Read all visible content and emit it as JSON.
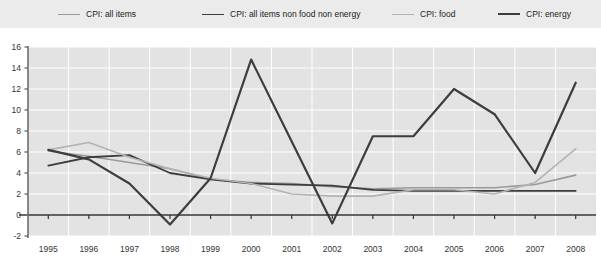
{
  "legend": {
    "position": "top",
    "items": [
      {
        "label": "CPI: all items",
        "color": "#9a9a9a",
        "width": 1.6,
        "x": 58
      },
      {
        "label": "CPI: all items non food non energy",
        "color": "#3d3d3d",
        "width": 1.8,
        "x": 202
      },
      {
        "label": "CPI:  food",
        "color": "#b3b3b3",
        "width": 1.6,
        "x": 392
      },
      {
        "label": "CPI:  energy",
        "color": "#3d3d3d",
        "width": 2.2,
        "x": 498
      }
    ]
  },
  "axes": {
    "y_ticks": [
      "16",
      "14",
      "12",
      "10",
      "8",
      "6",
      "4",
      "2",
      "0",
      "-2"
    ],
    "x_ticks": [
      "1995",
      "1996",
      "1997",
      "1998",
      "1999",
      "2000",
      "2001",
      "2002",
      "2003",
      "2004",
      "2005",
      "2006",
      "2007",
      "2008"
    ],
    "ylim": [
      -2,
      16
    ],
    "ystep": 2,
    "grid": true,
    "axis_color": "#6e6e6e",
    "grid_color": "#ffffff",
    "plot_bg": "#e3e3e3",
    "zero_line_color": "#333333"
  },
  "chart_data": {
    "type": "line",
    "title": "",
    "xlabel": "",
    "ylabel": "",
    "ylim": [
      -2,
      16
    ],
    "grid": true,
    "legend_position": "top",
    "x": [
      1995,
      1996,
      1997,
      1998,
      1999,
      2000,
      2001,
      2002,
      2003,
      2004,
      2005,
      2006,
      2007,
      2008
    ],
    "categories": [
      "1995",
      "1996",
      "1997",
      "1998",
      "1999",
      "2000",
      "2001",
      "2002",
      "2003",
      "2004",
      "2005",
      "2006",
      "2007",
      "2008"
    ],
    "series": [
      {
        "name": "CPI: all items",
        "color": "#9a9a9a",
        "width": 1.6,
        "values": [
          6.1,
          5.6,
          5.0,
          4.4,
          3.4,
          3.1,
          3.0,
          2.7,
          2.5,
          2.6,
          2.6,
          2.6,
          2.9,
          3.8
        ]
      },
      {
        "name": "CPI: all items non food non energy",
        "color": "#3d3d3d",
        "width": 1.8,
        "values": [
          4.7,
          5.5,
          5.7,
          4.0,
          3.4,
          3.0,
          2.9,
          2.8,
          2.4,
          2.3,
          2.3,
          2.3,
          2.3,
          2.3
        ]
      },
      {
        "name": "CPI:  food",
        "color": "#b3b3b3",
        "width": 1.6,
        "values": [
          6.2,
          6.9,
          5.5,
          4.4,
          3.5,
          3.0,
          2.0,
          1.8,
          1.8,
          2.4,
          2.4,
          2.0,
          3.1,
          6.3
        ]
      },
      {
        "name": "CPI:  energy",
        "color": "#3d3d3d",
        "width": 2.2,
        "values": [
          6.2,
          5.3,
          3.0,
          -0.9,
          3.5,
          14.8,
          7.0,
          -0.8,
          7.5,
          7.5,
          12.0,
          9.6,
          4.0,
          12.6
        ]
      }
    ]
  }
}
